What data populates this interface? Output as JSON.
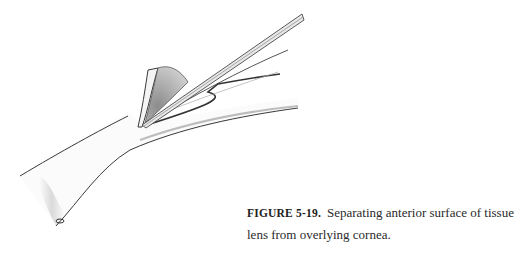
{
  "figure": {
    "illustration": {
      "description": "Pencil drawing of corneal tissue with a lamellar flap being separated by a blade instrument",
      "colors": {
        "stroke": "#3a3a3a",
        "shade": "#9a9a9a",
        "light_shade": "#cfcfcf",
        "background": "#ffffff"
      }
    },
    "caption": {
      "label": "FIGURE 5-19.",
      "text": "Separating anterior surface of tissue lens from overlying cornea."
    }
  }
}
